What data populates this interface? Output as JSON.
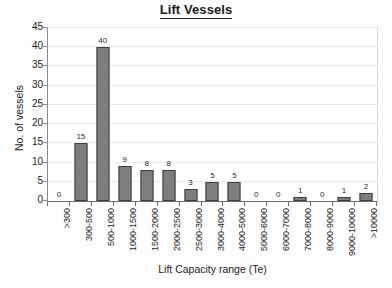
{
  "chart_data": {
    "type": "bar",
    "title": "Lift Vessels",
    "xlabel": "Lift Capacity range (Te)",
    "ylabel": "No. of vessels",
    "ylim": [
      0,
      45
    ],
    "ytick_step": 5,
    "yticks": [
      0,
      5,
      10,
      15,
      20,
      25,
      30,
      35,
      40,
      45
    ],
    "grid": true,
    "legend": null,
    "bar_color": "#7e7e7e",
    "bar_border_color": "#3d3d3d",
    "categories": [
      ">300",
      "300-500",
      "500-1000",
      "1000-1500",
      "1500-2000",
      "2000-2500",
      "2500-3000",
      "3000-4000",
      "4000-5000",
      "5000-6000",
      "6000-7000",
      "7000-8000",
      "8000-9000",
      "9000-10000",
      ">10000"
    ],
    "values": [
      0,
      15,
      40,
      9,
      8,
      8,
      3,
      5,
      5,
      0,
      0,
      1,
      0,
      1,
      2
    ],
    "data_labels": [
      "0",
      "15",
      "40",
      "9",
      "8",
      "8",
      "3",
      "5",
      "5",
      "0",
      "0",
      "1",
      "0",
      "1",
      "2"
    ]
  }
}
